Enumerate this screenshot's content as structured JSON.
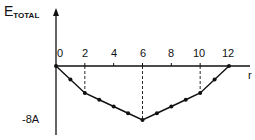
{
  "chart_data": {
    "type": "line",
    "title": "",
    "ylabel": "E",
    "ylabel_sub": "TOTAL",
    "xlabel": "r",
    "x_ticks": [
      "0",
      "2",
      "4",
      "6",
      "8",
      "10",
      "12"
    ],
    "y_tick_label": "-8A",
    "x": [
      0,
      1,
      2,
      3,
      4,
      5,
      6,
      7,
      8,
      9,
      10,
      11,
      12
    ],
    "series": [
      {
        "name": "E_TOTAL",
        "values": [
          0,
          -2,
          -4,
          -5,
          -6,
          -7,
          -8,
          -7,
          -6,
          -5,
          -4,
          -2,
          0
        ]
      }
    ],
    "dashed_guides_at_x": [
      2,
      6,
      10
    ],
    "xlim": [
      0,
      12
    ],
    "ylim": [
      -8,
      0
    ],
    "grid": false,
    "markers": "filled circles"
  },
  "labels": {
    "ylabel_main": "E",
    "ylabel_sub": "TOTAL",
    "xlabel": "r",
    "ymin": "-8A",
    "ticks": [
      "0",
      "2",
      "4",
      "6",
      "8",
      "10",
      "12"
    ]
  }
}
